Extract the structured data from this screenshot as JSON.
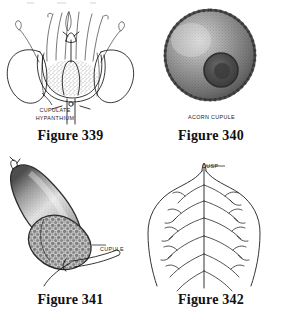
{
  "plate": {
    "title": "Botanical illustration plate: cupule and cusp morphology",
    "background_color": "#ffffff",
    "ink_color": "#111111",
    "columns": 2,
    "rows": 2
  },
  "figures": [
    {
      "id": "figure-339",
      "caption": "Figure 339",
      "subject": "Longitudinal section of a flower showing a cupulate hypanthium",
      "annotations": [
        {
          "name": "cupulate-hypanthium",
          "line1": "CUPULATE",
          "line2": "HYPANTHIUM",
          "leader": "true"
        }
      ],
      "rendering": "line-drawing"
    },
    {
      "id": "figure-340",
      "caption": "Figure 340",
      "subject": "Acorn cupule viewed from above, stippled shading",
      "annotations": [
        {
          "name": "acorn-cupule",
          "line1": "ACORN CUPULE",
          "line2": "",
          "leader": "false"
        }
      ],
      "rendering": "stipple-shaded"
    },
    {
      "id": "figure-341",
      "caption": "Figure 341",
      "subject": "Acorn with scaly cupule and peduncle, stippled shading",
      "annotations": [
        {
          "name": "cupule",
          "line1": "CUPULE",
          "line2": "",
          "leader": "true"
        }
      ],
      "rendering": "stipple-shaded"
    },
    {
      "id": "figure-342",
      "caption": "Figure 342",
      "subject": "Leaf apex with pinnate venation terminating in a cusp",
      "annotations": [
        {
          "name": "cusp",
          "line1": "CUSP",
          "line2": "",
          "leader": "true"
        }
      ],
      "rendering": "line-drawing"
    }
  ]
}
